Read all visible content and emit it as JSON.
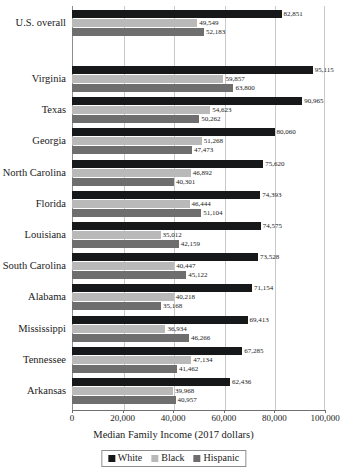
{
  "chart_data": {
    "type": "bar",
    "orientation": "horizontal",
    "title": "",
    "xlabel": "Median Family Income (2017 dollars)",
    "ylabel": "",
    "xlim": [
      0,
      100000
    ],
    "xticks": [
      0,
      20000,
      40000,
      60000,
      80000,
      100000
    ],
    "xtick_labels": [
      "0",
      "20,000",
      "40,000",
      "60,000",
      "80,000",
      "100,000"
    ],
    "grid": true,
    "grid_axis": "x",
    "legend_position": "bottom",
    "categories": [
      "U.S. overall",
      "Virginia",
      "Texas",
      "Georgia",
      "North Carolina",
      "Florida",
      "Louisiana",
      "South Carolina",
      "Alabama",
      "Mississippi",
      "Tennessee",
      "Arkansas"
    ],
    "series": [
      {
        "name": "White",
        "color": "#17181a",
        "values": [
          82851,
          95115,
          90965,
          80060,
          75620,
          74393,
          74575,
          73528,
          71154,
          69413,
          67285,
          62436
        ],
        "labels": [
          "82,851",
          "95,115",
          "90,965",
          "80,060",
          "75,620",
          "74,393",
          "74,575",
          "73,528",
          "71,154",
          "69,413",
          "67,285",
          "62,436"
        ]
      },
      {
        "name": "Black",
        "color": "#b9b9b9",
        "values": [
          49549,
          59857,
          54623,
          51268,
          46892,
          46444,
          35012,
          40447,
          40218,
          36934,
          47134,
          39968
        ],
        "labels": [
          "49,549",
          "59,857",
          "54,623",
          "51,268",
          "46,892",
          "46,444",
          "35,012",
          "40,447",
          "40,218",
          "36,934",
          "47,134",
          "39,968"
        ]
      },
      {
        "name": "Hispanic",
        "color": "#6e6e6e",
        "values": [
          52183,
          63800,
          50262,
          47473,
          40301,
          51104,
          42159,
          45122,
          35168,
          46266,
          41462,
          40957
        ],
        "labels": [
          "52,183",
          "63,800",
          "50,262",
          "47,473",
          "40,301",
          "51,104",
          "42,159",
          "45,122",
          "35,168",
          "46,266",
          "41,462",
          "40,957"
        ]
      }
    ]
  },
  "legend": {
    "entries": [
      {
        "label": "White"
      },
      {
        "label": "Black"
      },
      {
        "label": "Hispanic"
      }
    ]
  }
}
